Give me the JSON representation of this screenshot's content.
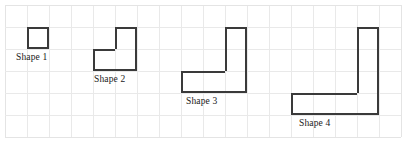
{
  "figure": {
    "type": "grid-shape-diagram",
    "canvas": {
      "width": 407,
      "height": 147,
      "background": "#ffffff"
    },
    "grid": {
      "origin_x": 5,
      "origin_y": 5,
      "cell_size": 22,
      "columns": 18,
      "rows": 6,
      "line_color": "#e9e9e9",
      "border_color": "#e4e4e4",
      "visible": true
    },
    "stroke": {
      "color": "#3a3a3a",
      "width": 1.6
    }
  },
  "shapes": [
    {
      "id": "shape-1",
      "label": "Shape 1",
      "cell_count": 1,
      "cells": [
        {
          "col": 1,
          "row": 1
        }
      ],
      "label_position": {
        "col": 0,
        "row": 2,
        "dx": 11,
        "dy": 3
      }
    },
    {
      "id": "shape-2",
      "label": "Shape 2",
      "cell_count": 3,
      "cells": [
        {
          "col": 5,
          "row": 1
        },
        {
          "col": 4,
          "row": 2
        },
        {
          "col": 5,
          "row": 2
        }
      ],
      "label_position": {
        "col": 4,
        "row": 3,
        "dx": 1,
        "dy": 3
      }
    },
    {
      "id": "shape-3",
      "label": "Shape 3",
      "cell_count": 5,
      "cells": [
        {
          "col": 10,
          "row": 1
        },
        {
          "col": 10,
          "row": 2
        },
        {
          "col": 8,
          "row": 3
        },
        {
          "col": 9,
          "row": 3
        },
        {
          "col": 10,
          "row": 3
        }
      ],
      "label_position": {
        "col": 8,
        "row": 4,
        "dx": 5,
        "dy": 3
      }
    },
    {
      "id": "shape-4",
      "label": "Shape 4",
      "cell_count": 7,
      "cells": [
        {
          "col": 16,
          "row": 1
        },
        {
          "col": 16,
          "row": 2
        },
        {
          "col": 16,
          "row": 3
        },
        {
          "col": 13,
          "row": 4
        },
        {
          "col": 14,
          "row": 4
        },
        {
          "col": 15,
          "row": 4
        },
        {
          "col": 16,
          "row": 4
        }
      ],
      "label_position": {
        "col": 13,
        "row": 5,
        "dx": 8,
        "dy": 3
      }
    }
  ]
}
